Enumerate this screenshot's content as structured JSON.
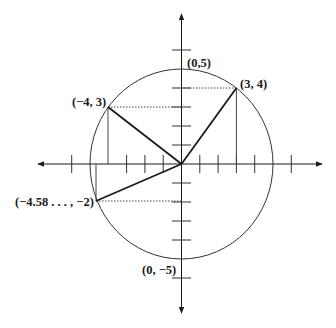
{
  "diagram": {
    "type": "coordinate-plane-circle",
    "circle": {
      "center": [
        0,
        0
      ],
      "radius": 5
    },
    "axes": {
      "x_range": [
        -6,
        6
      ],
      "y_range": [
        -6,
        6
      ],
      "tick_step": 1
    },
    "points": [
      {
        "id": "p34",
        "x": 3,
        "y": 4,
        "label": "(3, 4)"
      },
      {
        "id": "p05",
        "x": 0,
        "y": 5,
        "label": "(0,5)"
      },
      {
        "id": "pm43",
        "x": -4,
        "y": 3,
        "label": "(−4, 3)"
      },
      {
        "id": "pm458",
        "x": -4.58,
        "y": -2,
        "label": "(−4.58 . . . , −2)"
      },
      {
        "id": "p0m5",
        "x": 0,
        "y": -5,
        "label": "(0, −5)"
      }
    ],
    "radii_drawn_to": [
      "(3, 4)",
      "(−4, 3)",
      "(−4.58 . . . , −2)"
    ],
    "colors": {
      "stroke": "#1a1a1a",
      "background": "#ffffff"
    }
  }
}
